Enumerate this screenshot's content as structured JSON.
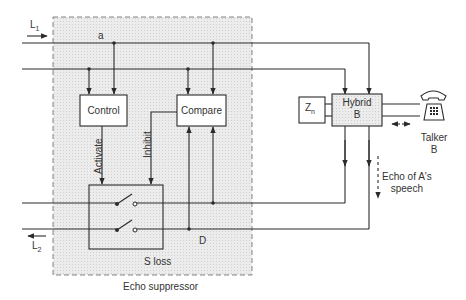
{
  "diagram": {
    "title": "Echo suppressor",
    "lines": {
      "incoming": {
        "label": "L",
        "subscript": "1",
        "direction": "right"
      },
      "outgoing": {
        "label": "L",
        "subscript": "2",
        "direction": "left"
      },
      "node_a": "a",
      "node_d": "D"
    },
    "blocks": {
      "control": "Control",
      "compare": "Compare",
      "hybrid_line1": "Hybrid",
      "hybrid_line2": "B",
      "impedance": "Z",
      "impedance_sub": "n",
      "switch_area_label": "S loss"
    },
    "signals": {
      "activate": "Activate",
      "inhibit": "Inhibit"
    },
    "talker": {
      "line1": "Talker",
      "line2": "B"
    },
    "echo_label": {
      "line1": "Echo of A's",
      "line2": "speech"
    },
    "caption": "Echo suppressor",
    "colors": {
      "line": "#2a2a2a",
      "shade": "#e6e6e6",
      "background": "#ffffff"
    }
  }
}
